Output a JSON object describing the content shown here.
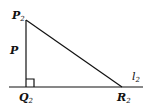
{
  "diagram": {
    "type": "right-triangle",
    "stroke_color": "#111111",
    "background": "#ffffff",
    "vertices": {
      "P2": {
        "label": "P",
        "subscript": "2",
        "x": 26,
        "y": 20
      },
      "Q2": {
        "label": "Q",
        "subscript": "2",
        "x": 26,
        "y": 87
      },
      "R2": {
        "label": "R",
        "subscript": "2",
        "x": 122,
        "y": 87
      }
    },
    "side_label": {
      "text": "P"
    },
    "line_label": {
      "text": "l",
      "subscript": "2"
    },
    "right_angle_at": "Q2"
  }
}
